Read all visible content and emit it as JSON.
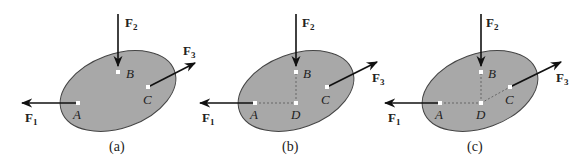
{
  "figure": {
    "colors": {
      "body_fill": "#a8a8a8",
      "body_stroke": "#444444",
      "arrow": "#111111",
      "dashed": "#555555",
      "point": "#ffffff"
    },
    "panels": [
      {
        "caption": "(a)",
        "points": {
          "A": "A",
          "B": "B",
          "C": "C"
        },
        "forces": {
          "F1": {
            "main": "F",
            "sub": "1"
          },
          "F2": {
            "main": "F",
            "sub": "2"
          },
          "F3": {
            "main": "F",
            "sub": "3"
          }
        }
      },
      {
        "caption": "(b)",
        "points": {
          "A": "A",
          "B": "B",
          "C": "C",
          "D": "D"
        },
        "forces": {
          "F1": {
            "main": "F",
            "sub": "1"
          },
          "F2": {
            "main": "F",
            "sub": "2"
          },
          "F3": {
            "main": "F",
            "sub": "3"
          }
        }
      },
      {
        "caption": "(c)",
        "points": {
          "A": "A",
          "B": "B",
          "C": "C",
          "D": "D"
        },
        "forces": {
          "F1": {
            "main": "F",
            "sub": "1"
          },
          "F2": {
            "main": "F",
            "sub": "2"
          },
          "F3": {
            "main": "F",
            "sub": "3"
          }
        }
      }
    ]
  }
}
